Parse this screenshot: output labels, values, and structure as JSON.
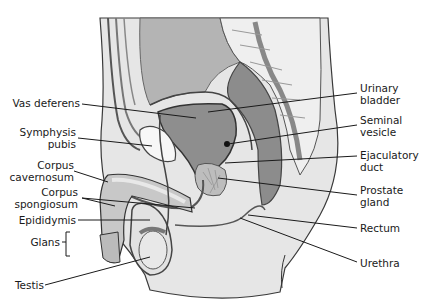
{
  "figure": {
    "colors": {
      "background": "#ffffff",
      "skin": "#e6e6e6",
      "tissue_light": "#d0d0d0",
      "tissue_mid": "#a8a8a8",
      "tissue_dark": "#8a8a8a",
      "bone": "#f2f2f2",
      "outline": "#3a3a3a",
      "leader": "#1a1a1a"
    }
  },
  "labels_left": [
    {
      "id": "vas-deferens",
      "lines": [
        "Vas deferens"
      ]
    },
    {
      "id": "symphysis-pubis",
      "lines": [
        "Symphysis",
        "pubis"
      ]
    },
    {
      "id": "corpus-cavernosum",
      "lines": [
        "Corpus",
        "cavernosum"
      ]
    },
    {
      "id": "corpus-spongiosum",
      "lines": [
        "Corpus",
        "spongiosum"
      ]
    },
    {
      "id": "epididymis",
      "lines": [
        "Epididymis"
      ]
    },
    {
      "id": "glans",
      "lines": [
        "Glans"
      ]
    },
    {
      "id": "testis",
      "lines": [
        "Testis"
      ]
    }
  ],
  "labels_right": [
    {
      "id": "urinary-bladder",
      "lines": [
        "Urinary",
        "bladder"
      ]
    },
    {
      "id": "seminal-vesicle",
      "lines": [
        "Seminal",
        "vesicle"
      ]
    },
    {
      "id": "ejaculatory-duct",
      "lines": [
        "Ejaculatory",
        "duct"
      ]
    },
    {
      "id": "prostate-gland",
      "lines": [
        "Prostate",
        "gland"
      ]
    },
    {
      "id": "rectum",
      "lines": [
        "Rectum"
      ]
    },
    {
      "id": "urethra",
      "lines": [
        "Urethra"
      ]
    }
  ]
}
